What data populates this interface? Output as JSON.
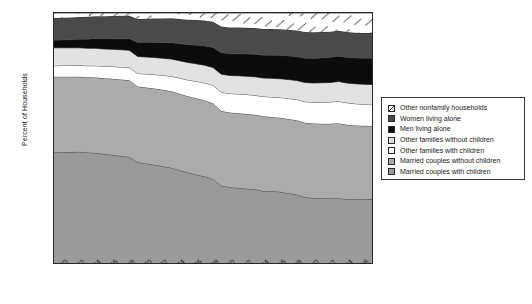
{
  "chart_data": {
    "type": "area",
    "stacked": true,
    "title": "",
    "xlabel": "",
    "ylabel": "Percent of Households",
    "ylim": [
      0,
      100
    ],
    "xlim": [
      1960,
      1998
    ],
    "ytick_step": 10,
    "xtick_step": 2,
    "grid": false,
    "legend_position": "right",
    "yticks": [
      "0",
      "10",
      "20",
      "30",
      "40",
      "50",
      "60",
      "70",
      "80",
      "90",
      "100"
    ],
    "x": [
      1960,
      1961,
      1962,
      1963,
      1964,
      1965,
      1966,
      1967,
      1968,
      1969,
      1970,
      1971,
      1972,
      1973,
      1974,
      1975,
      1976,
      1977,
      1978,
      1979,
      1980,
      1981,
      1982,
      1983,
      1984,
      1985,
      1986,
      1987,
      1988,
      1989,
      1990,
      1991,
      1992,
      1993,
      1994,
      1995,
      1996,
      1997,
      1998
    ],
    "xticklabels": [
      "1960",
      "1962",
      "1964",
      "1966",
      "1968",
      "1970",
      "1972",
      "1974",
      "1976",
      "1978",
      "1980",
      "1982",
      "1984",
      "1986",
      "1988",
      "1990",
      "1992",
      "1994",
      "1996",
      "1998"
    ],
    "series": [
      {
        "name": "Married couples with children",
        "fill": "#9a9a9a",
        "pattern": "solid",
        "values": [
          44.2,
          44.3,
          44.4,
          44.5,
          44.2,
          44.0,
          43.6,
          43.2,
          42.8,
          42.4,
          40.3,
          39.8,
          39.3,
          38.7,
          38.1,
          37.1,
          36.2,
          35.4,
          34.6,
          33.6,
          30.9,
          30.3,
          30.0,
          29.7,
          29.5,
          28.8,
          28.7,
          28.5,
          27.9,
          27.4,
          26.3,
          26.0,
          25.9,
          25.8,
          25.9,
          25.5,
          25.4,
          25.5,
          25.6
        ]
      },
      {
        "name": "Married couples without children",
        "fill": "#ababab",
        "pattern": "solid",
        "values": [
          30.3,
          30.2,
          30.1,
          30.0,
          30.1,
          30.2,
          30.3,
          30.5,
          30.6,
          30.7,
          30.3,
          30.4,
          30.5,
          30.6,
          30.6,
          30.6,
          30.5,
          30.5,
          30.4,
          30.3,
          29.9,
          29.9,
          29.9,
          29.9,
          29.8,
          29.9,
          29.7,
          29.6,
          29.7,
          29.7,
          29.8,
          29.8,
          29.8,
          29.9,
          30.0,
          29.8,
          29.6,
          29.4,
          29.2
        ]
      },
      {
        "name": "Other families with children",
        "fill": "#ffffff",
        "pattern": "solid",
        "values": [
          4.4,
          4.5,
          4.5,
          4.6,
          4.6,
          4.7,
          4.8,
          4.9,
          5.0,
          5.1,
          5.2,
          5.4,
          5.6,
          5.8,
          6.0,
          6.3,
          6.5,
          6.8,
          7.0,
          7.2,
          7.5,
          7.6,
          7.7,
          7.8,
          7.8,
          7.9,
          8.0,
          8.1,
          8.2,
          8.3,
          8.4,
          8.5,
          8.6,
          8.7,
          8.8,
          8.8,
          8.7,
          8.6,
          8.5
        ]
      },
      {
        "name": "Other families without children",
        "fill": "#e2e2e2",
        "pattern": "solid",
        "values": [
          7.2,
          7.1,
          7.1,
          7.0,
          7.0,
          7.0,
          6.9,
          6.9,
          6.9,
          6.9,
          6.8,
          6.8,
          6.8,
          6.8,
          6.9,
          6.9,
          7.0,
          7.0,
          7.1,
          7.1,
          7.2,
          7.2,
          7.3,
          7.3,
          7.4,
          7.4,
          7.5,
          7.5,
          7.6,
          7.6,
          7.7,
          7.7,
          7.8,
          7.8,
          7.9,
          7.9,
          8.0,
          8.0,
          8.1
        ]
      },
      {
        "name": "Men living alone",
        "fill": "#0c0c0c",
        "pattern": "solid",
        "values": [
          3.0,
          3.1,
          3.2,
          3.4,
          3.6,
          3.8,
          4.0,
          4.2,
          4.4,
          4.6,
          5.6,
          5.8,
          6.0,
          6.2,
          6.5,
          6.8,
          7.1,
          7.4,
          7.7,
          8.0,
          8.6,
          8.7,
          8.8,
          8.9,
          9.0,
          9.1,
          9.2,
          9.3,
          9.4,
          9.5,
          9.7,
          9.8,
          9.9,
          10.0,
          10.1,
          10.2,
          10.3,
          10.4,
          10.5
        ]
      },
      {
        "name": "Women living alone",
        "fill": "#4a4a4a",
        "pattern": "solid",
        "values": [
          8.9,
          8.9,
          8.9,
          8.9,
          9.0,
          9.0,
          9.1,
          9.1,
          9.2,
          9.2,
          9.4,
          9.5,
          9.6,
          9.7,
          9.8,
          9.9,
          10.0,
          10.1,
          10.2,
          10.3,
          10.5,
          10.5,
          10.5,
          10.5,
          10.5,
          10.5,
          10.5,
          10.5,
          10.5,
          10.5,
          10.5,
          10.5,
          10.4,
          10.3,
          10.2,
          10.2,
          10.1,
          10.1,
          10.1
        ]
      },
      {
        "name": "Other nonfamily households",
        "fill": "#ffffff",
        "pattern": "hatched",
        "values": [
          2.0,
          1.9,
          1.8,
          1.6,
          1.5,
          1.3,
          1.3,
          1.2,
          1.1,
          1.1,
          2.4,
          2.3,
          2.2,
          2.2,
          2.1,
          2.4,
          2.7,
          2.8,
          3.0,
          3.5,
          5.4,
          5.8,
          5.8,
          5.9,
          6.0,
          6.4,
          6.4,
          6.5,
          6.7,
          7.0,
          7.6,
          7.7,
          7.6,
          7.5,
          7.1,
          7.6,
          7.9,
          8.0,
          8.0
        ]
      }
    ]
  },
  "axis": {
    "ylabel": "Percent of Households"
  },
  "legend": {
    "items": [
      {
        "label": "Other nonfamily households",
        "swatch": "hatched-swatch"
      },
      {
        "label": "Women living alone",
        "swatch": "dark-gray-swatch"
      },
      {
        "label": "Men living alone",
        "swatch": "black-swatch"
      },
      {
        "label": "Other families without children",
        "swatch": "light-gray-swatch"
      },
      {
        "label": "Other families with children",
        "swatch": "white-swatch"
      },
      {
        "label": "Married couples without children",
        "swatch": "mid-light-gray-swatch"
      },
      {
        "label": "Married couples with children",
        "swatch": "mid-gray-swatch"
      }
    ]
  }
}
